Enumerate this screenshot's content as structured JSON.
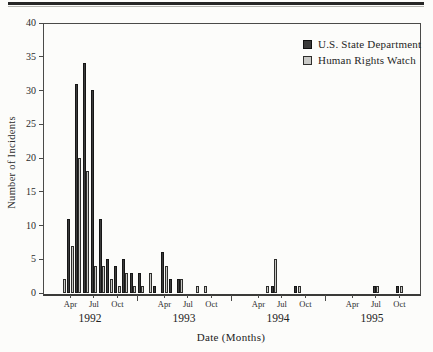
{
  "chart_data": {
    "type": "bar",
    "title": "",
    "xlabel": "Date (Months)",
    "ylabel": "Number of Incidents",
    "ylim": [
      0,
      40
    ],
    "yticks": [
      0,
      5,
      10,
      15,
      20,
      25,
      30,
      35,
      40
    ],
    "grid": false,
    "legend_position": "top-right",
    "years": [
      "1992",
      "1993",
      "1994",
      "1995"
    ],
    "labeled_months": [
      "Apr",
      "Jul",
      "Oct"
    ],
    "x_months": [
      "Jan 1992",
      "Feb 1992",
      "Mar 1992",
      "Apr 1992",
      "May 1992",
      "Jun 1992",
      "Jul 1992",
      "Aug 1992",
      "Sep 1992",
      "Oct 1992",
      "Nov 1992",
      "Dec 1992",
      "Jan 1993",
      "Feb 1993",
      "Mar 1993",
      "Apr 1993",
      "May 1993",
      "Jun 1993",
      "Jul 1993",
      "Aug 1993",
      "Sep 1993",
      "Oct 1993",
      "Nov 1993",
      "Dec 1993",
      "Jan 1994",
      "Feb 1994",
      "Mar 1994",
      "Apr 1994",
      "May 1994",
      "Jun 1994",
      "Jul 1994",
      "Aug 1994",
      "Sep 1994",
      "Oct 1994",
      "Nov 1994",
      "Dec 1994",
      "Jan 1995",
      "Feb 1995",
      "Mar 1995",
      "Apr 1995",
      "May 1995",
      "Jun 1995",
      "Jul 1995",
      "Aug 1995",
      "Sep 1995",
      "Oct 1995",
      "Nov 1995",
      "Dec 1995"
    ],
    "series": [
      {
        "name": "U.S. State Department",
        "color": "#3b3b3b",
        "values": [
          0,
          0,
          0,
          11,
          31,
          34,
          30,
          11,
          5,
          4,
          5,
          3,
          3,
          0,
          1,
          6,
          2,
          2,
          0,
          0,
          0,
          0,
          0,
          0,
          0,
          0,
          0,
          0,
          0,
          1,
          0,
          0,
          1,
          0,
          0,
          0,
          0,
          0,
          0,
          0,
          0,
          0,
          1,
          0,
          0,
          1,
          0,
          0
        ]
      },
      {
        "name": "Human Rights Watch",
        "color": "#c9c9c6",
        "values": [
          0,
          0,
          2,
          7,
          20,
          18,
          4,
          4,
          2,
          1,
          3,
          1,
          1,
          3,
          0,
          4,
          0,
          2,
          0,
          1,
          1,
          0,
          0,
          0,
          0,
          0,
          0,
          0,
          1,
          5,
          0,
          0,
          1,
          0,
          0,
          0,
          0,
          0,
          0,
          0,
          0,
          0,
          1,
          0,
          0,
          1,
          0,
          0
        ]
      }
    ]
  }
}
